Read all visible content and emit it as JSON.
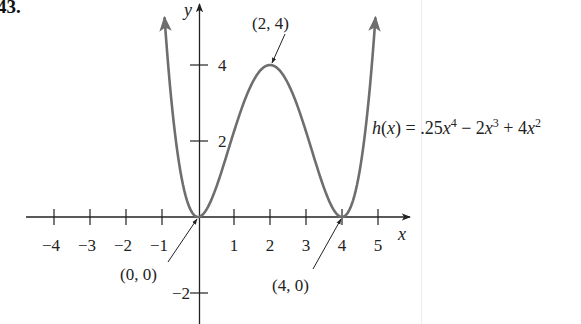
{
  "problem_number": "43.",
  "chart_data": {
    "type": "line",
    "title": "",
    "function": "h(x) = .25x^4 - 2x^3 + 4x^2",
    "coefficients": {
      "x4": 0.25,
      "x3": -2,
      "x2": 4,
      "x1": 0,
      "x0": 0
    },
    "xlabel": "x",
    "ylabel": "y",
    "x_ticks": [
      -4,
      -3,
      -2,
      -1,
      1,
      2,
      3,
      4,
      5
    ],
    "x_tick_labels": [
      "−4",
      "−3",
      "−2",
      "−1",
      "1",
      "2",
      "3",
      "4",
      "5"
    ],
    "y_ticks": [
      4,
      2,
      -2
    ],
    "y_tick_labels": [
      "4",
      "2",
      "−2"
    ],
    "xlim": [
      -4.2,
      5.8
    ],
    "ylim": [
      -2.5,
      5.6
    ],
    "grid": false,
    "series": [
      {
        "name": "h(x)",
        "x": [
          -0.93,
          -0.5,
          0,
          0.5,
          1,
          1.5,
          2,
          2.5,
          3,
          3.5,
          4,
          4.5,
          4.93
        ],
        "y": [
          5.2,
          1.27,
          0,
          0.77,
          2.25,
          3.52,
          4,
          3.52,
          2.25,
          0.77,
          0,
          1.27,
          5.2
        ]
      }
    ],
    "annotations": [
      {
        "label": "(2, 4)",
        "point": [
          2,
          4
        ]
      },
      {
        "label": "(0, 0)",
        "point": [
          0,
          0
        ]
      },
      {
        "label": "(4, 0)",
        "point": [
          4,
          0
        ]
      }
    ],
    "curve_color": "#6e6e6e",
    "axis_color": "#222222"
  },
  "labels": {
    "formula_lhs": "h(x) = .25x",
    "formula": "h(x) = .25x⁴ − 2x³ + 4x²",
    "pt_max": "(2, 4)",
    "pt_origin": "(0, 0)",
    "pt_root": "(4, 0)",
    "x_var": "x",
    "y_var": "y"
  }
}
